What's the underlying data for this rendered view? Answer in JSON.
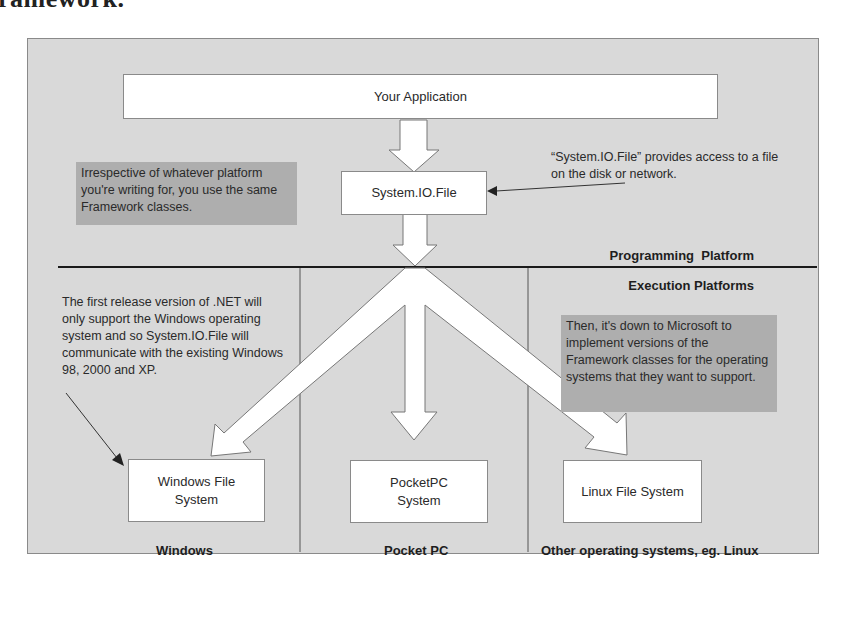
{
  "page": {
    "cut_heading": "ramework."
  },
  "diagram": {
    "boxes": {
      "application": "Your Application",
      "system_io_file": "System.IO.File",
      "windows_fs": "Windows File System",
      "pocketpc_fs": "PocketPC System",
      "linux_fs": "Linux File System"
    },
    "notes": {
      "same_classes": "Irrespective of whatever platform you're writing for, you use the same Framework classes.",
      "file_access": "“System.IO.File” provides access to a file on the disk or network.",
      "first_release": "The first release version of .NET will only support the Windows operating system and so System.IO.File will communicate with the existing Windows 98, 2000 and XP.",
      "microsoft": "Then, it's down to Microsoft to implement versions of the Framework classes for the operating systems that they want to support."
    },
    "section_labels": {
      "programming_platform": "Programming  Platform",
      "execution_platforms": "Execution Platforms"
    },
    "platform_labels": {
      "windows": "Windows",
      "pocket_pc": "Pocket PC",
      "other": "Other operating systems, eg. Linux"
    },
    "colors": {
      "panel_bg": "#d9d9d9",
      "note_shade": "#aeaeae",
      "box_fill": "#ffffff",
      "divider": "#1a1a1a"
    }
  }
}
